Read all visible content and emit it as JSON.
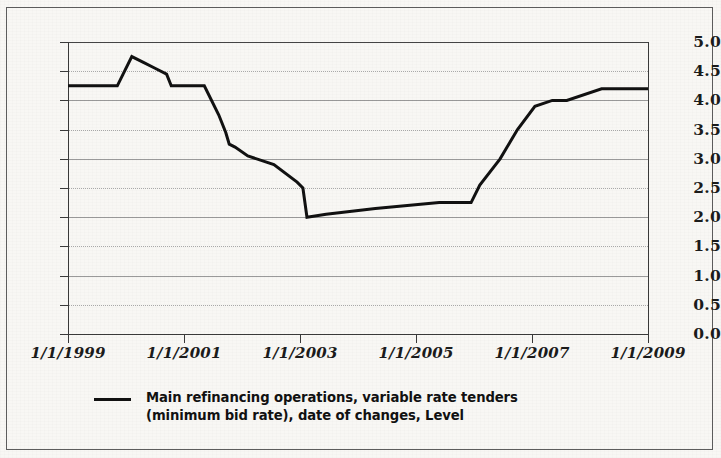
{
  "chart_data": {
    "type": "line",
    "title": "",
    "subtitle": "",
    "xlabel": "",
    "ylabel": "",
    "ylim": [
      0.0,
      5.0
    ],
    "xlim": [
      "1/1/1999",
      "1/1/2009"
    ],
    "grid": true,
    "legend_position": "bottom-left",
    "y_ticks": [
      "5.0",
      "4.5",
      "4.0",
      "3.5",
      "3.0",
      "2.5",
      "2.0",
      "1.5",
      "1.0",
      "0.5",
      "0.0"
    ],
    "y_tick_values": [
      5.0,
      4.5,
      4.0,
      3.5,
      3.0,
      2.5,
      2.0,
      1.5,
      1.0,
      0.5,
      0.0
    ],
    "x_ticks": [
      "1/1/1999",
      "1/1/2001",
      "1/1/2003",
      "1/1/2005",
      "1/1/2007",
      "1/1/2009"
    ],
    "x_tick_values": [
      1999.0,
      2001.0,
      2003.0,
      2005.0,
      2007.0,
      2009.0
    ],
    "series": [
      {
        "name": "Main refinancing operations, variable rate tenders (minimum bid rate), date of changes, Level",
        "color": "#111111",
        "line_width": 3.0,
        "x": [
          1999.0,
          1999.5,
          1999.85,
          2000.1,
          2000.3,
          2000.5,
          2000.7,
          2000.78,
          2001.35,
          2001.6,
          2001.72,
          2001.78,
          2001.88,
          2002.1,
          2002.55,
          2002.95,
          2003.05,
          2003.12,
          2003.45,
          2004.3,
          2005.4,
          2005.95,
          2006.1,
          2006.45,
          2006.75,
          2007.05,
          2007.35,
          2007.6,
          2008.2,
          2009.0
        ],
        "y": [
          4.25,
          4.25,
          4.25,
          4.75,
          4.65,
          4.55,
          4.45,
          4.25,
          4.25,
          3.75,
          3.45,
          3.25,
          3.2,
          3.05,
          2.9,
          2.6,
          2.5,
          2.0,
          2.05,
          2.15,
          2.25,
          2.25,
          2.55,
          3.0,
          3.5,
          3.9,
          4.0,
          4.0,
          4.2,
          4.2
        ],
        "min_value": 2.0,
        "max_value": 4.75,
        "start_value": 4.25,
        "end_value": 4.2,
        "units": "percent (Level)"
      }
    ],
    "legend": [
      {
        "label_line_1": "Main refinancing operations, variable rate tenders",
        "label_line_2": "(minimum bid rate), date of changes, Level",
        "marker": "line",
        "color": "#111111"
      }
    ]
  },
  "colors": {
    "page_background": "#f8f7f4",
    "frame": "#5d5d5d",
    "axis": "#3a3a3a",
    "gridline_solid": "#9a9a9a",
    "gridline_dotted": "#a9a9a9",
    "series_line": "#111111",
    "text": "#1b1b1b"
  }
}
